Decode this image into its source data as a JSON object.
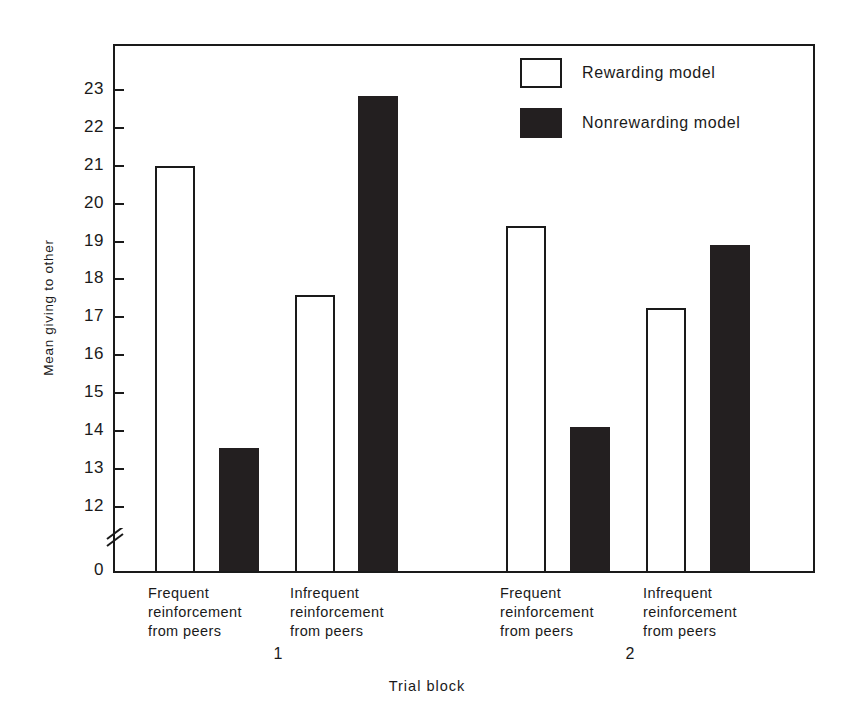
{
  "chart_data": {
    "type": "bar",
    "title": "",
    "xlabel": "Trial block",
    "ylabel": "Mean giving to other",
    "ylim": [
      12,
      23.5
    ],
    "y_axis_break": true,
    "y_baseline_label": "0",
    "grid": false,
    "legend_position": "top-right",
    "yticks": [
      "23",
      "22",
      "21",
      "20",
      "19",
      "18",
      "17",
      "16",
      "15",
      "14",
      "13",
      "12"
    ],
    "ytick_values": [
      23,
      22,
      21,
      20,
      19,
      18,
      17,
      16,
      15,
      14,
      13,
      12
    ],
    "groups": [
      {
        "block": "1",
        "categories": [
          "Frequent\nreinforcement\nfrom peers",
          "Infrequent\nreinforcement\nfrom peers"
        ]
      },
      {
        "block": "2",
        "categories": [
          "Frequent\nreinforcement\nfrom peers",
          "Infrequent\nreinforcement\nfrom peers"
        ]
      }
    ],
    "categories": [
      "Frequent reinforcement from peers (block 1)",
      "Infrequent reinforcement from peers (block 1)",
      "Frequent reinforcement from peers (block 2)",
      "Infrequent reinforcement from peers (block 2)"
    ],
    "series": [
      {
        "name": "Rewarding model",
        "color": "#ffffff",
        "values": [
          21.0,
          17.6,
          19.4,
          17.25
        ]
      },
      {
        "name": "Nonrewarding model",
        "color": "#231f20",
        "values": [
          13.55,
          22.85,
          14.1,
          18.9
        ]
      }
    ]
  },
  "legend": {
    "items": [
      {
        "label": "Rewarding model",
        "swatch": "open-square"
      },
      {
        "label": "Nonrewarding model",
        "swatch": "filled-square"
      }
    ]
  },
  "axes": {
    "y_title": "Mean giving to other",
    "x_title": "Trial block",
    "zero_label": "0"
  },
  "x_labels": [
    {
      "text": "Frequent\nreinforcement\nfrom peers"
    },
    {
      "text": "Infrequent\nreinforcement\nfrom peers"
    },
    {
      "text": "Frequent\nreinforcement\nfrom peers"
    },
    {
      "text": "Infrequent\nreinforcement\nfrom peers"
    }
  ],
  "block_labels": [
    {
      "text": "1"
    },
    {
      "text": "2"
    }
  ]
}
